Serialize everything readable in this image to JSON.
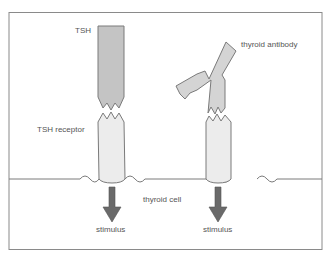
{
  "diagram": {
    "labels": {
      "tsh": "TSH",
      "tsh_receptor": "TSH receptor",
      "thyroid_antibody": "thyroid antibody",
      "thyroid_cell": "thyroid cell",
      "stimulus_left": "stimulus",
      "stimulus_right": "stimulus"
    },
    "colors": {
      "frame": "#8a8a8a",
      "tsh_fill": "#c4c4c4",
      "antibody_fill": "#d4d4d4",
      "receptor_fill": "#ececec",
      "arrow_fill": "#6a6a6a",
      "outline": "#7a7a7a",
      "text": "#555555"
    }
  }
}
